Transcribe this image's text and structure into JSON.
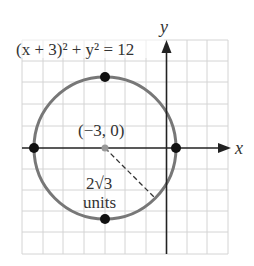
{
  "diagram": {
    "equation": "(x + 3)² + y² = 12",
    "center_label": "(−3, 0)",
    "radius_label_1": "2√3",
    "radius_label_2": "units",
    "x_axis_label": "x",
    "y_axis_label": "y",
    "center": [
      -3,
      0
    ],
    "radius": "2√3",
    "points": [
      [
        -3,
        3.46
      ],
      [
        -3,
        -3.46
      ],
      [
        -6.46,
        0
      ],
      [
        0.46,
        0
      ]
    ],
    "grid": {
      "x_range": [
        -7,
        3
      ],
      "y_range": [
        -5,
        5
      ],
      "step": 1
    },
    "colors": {
      "circle": "#777777",
      "grid": "#d0d0d0",
      "axis": "#222222",
      "point": "#111111"
    }
  }
}
